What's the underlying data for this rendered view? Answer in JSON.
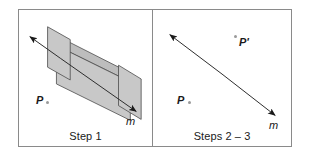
{
  "figure": {
    "background_color": "#ffffff",
    "frame_color": "#8a8a8a",
    "ink_color": "#1a1a1a",
    "slab_fill_color": "#c8c8c8",
    "slab_face_color": "#bdbdbd",
    "point_dot_color": "#9a9a9a"
  },
  "panels": [
    {
      "id": "step1",
      "caption": "Step 1",
      "labels": {
        "point_p": "P",
        "mirror_axis": "m"
      },
      "icons": {
        "slab": "prism-slab-icon",
        "axis_arrow": "double-arrow-icon",
        "point_marker": "point-dot-icon"
      }
    },
    {
      "id": "steps23",
      "caption": "Steps 2 – 3",
      "labels": {
        "point_p": "P",
        "point_p_prime": "P'",
        "mirror_axis": "m"
      },
      "icons": {
        "axis_arrow": "double-arrow-icon",
        "point_marker": "point-dot-icon"
      }
    }
  ]
}
